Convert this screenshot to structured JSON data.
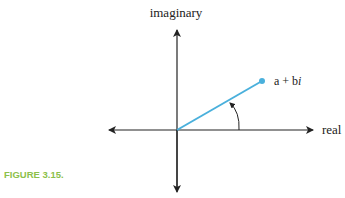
{
  "figure": {
    "caption": "FIGURE 3.15.",
    "axis_labels": {
      "vertical": "imaginary",
      "horizontal": "real"
    },
    "point_label_prefix": "a + b",
    "point_label_italic": "i",
    "colors": {
      "vector": "#4ab0dc",
      "axes": "#222222",
      "caption": "#8cc04a"
    },
    "elements": [
      "vertical-axis-with-arrows",
      "horizontal-axis-with-arrows",
      "vector-from-origin",
      "point-a-plus-bi",
      "angle-arc-arrow"
    ]
  }
}
